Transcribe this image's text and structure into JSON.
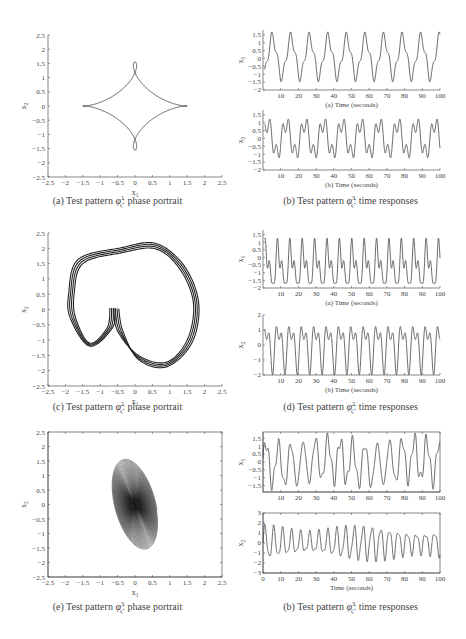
{
  "figures": [
    {
      "id": "a",
      "caption_prefix": "(a) Test pattern ",
      "caption_symbol": "φ",
      "caption_sup": "1",
      "caption_sub": "ς",
      "caption_suffix": ": phase portrait"
    },
    {
      "id": "b1",
      "caption_prefix": "(b) Test pattern ",
      "caption_symbol": "φ",
      "caption_sup": "3",
      "caption_sub": "ς",
      "caption_suffix": ": time responses"
    },
    {
      "id": "c",
      "caption_prefix": "(c) Test pattern ",
      "caption_symbol": "φ",
      "caption_sup": "2",
      "caption_sub": "ς",
      "caption_suffix": ": phase portrait"
    },
    {
      "id": "d",
      "caption_prefix": "(d) Test pattern ",
      "caption_symbol": "φ",
      "caption_sup": "2",
      "caption_sub": "ς",
      "caption_suffix": ": time responses"
    },
    {
      "id": "e",
      "caption_prefix": "(e) Test pattern ",
      "caption_symbol": "φ",
      "caption_sup": "3",
      "caption_sub": "ς",
      "caption_suffix": ": phase portrait"
    },
    {
      "id": "b2",
      "caption_prefix": "(b) Test pattern ",
      "caption_symbol": "φ",
      "caption_sup": "3",
      "caption_sub": "ς",
      "caption_suffix": ": time responses"
    }
  ],
  "chart_data": [
    {
      "panel": "a",
      "type": "line",
      "title": "(a) Test pattern φς1: phase portrait",
      "xlabel": "x1",
      "ylabel": "x2",
      "xlim": [
        -2.5,
        2.5
      ],
      "ylim": [
        -2.5,
        2.5
      ],
      "xticks": [
        "-2.5",
        "-2",
        "-1.5",
        "-1",
        "-0.5",
        "0",
        "0.5",
        "1",
        "1.5",
        "2",
        "2.5"
      ],
      "yticks": [
        "2.5",
        "2",
        "1.5",
        "1",
        "0.5",
        "0",
        "-0.5",
        "-1",
        "-1.5",
        "-2",
        "-2.5"
      ],
      "description": "Closed limit cycle with two small inner loops near x1=-1 and x1=1",
      "extent": {
        "x": [
          -1.6,
          1.6
        ],
        "y": [
          -1.45,
          1.45
        ]
      }
    },
    {
      "panel": "b-top",
      "type": "line",
      "sublabel": "(a) Time (seconds)",
      "ylabel": "x1",
      "xlim": [
        0,
        100
      ],
      "ylim": [
        -2,
        1.8
      ],
      "xticks": [
        "10",
        "20",
        "30",
        "40",
        "50",
        "60",
        "70",
        "80",
        "90",
        "100"
      ],
      "yticks": [
        "1.5",
        "1",
        "0.5",
        "0",
        "-0.5",
        "-1",
        "-1.5",
        "-2"
      ],
      "period_s": 10.5,
      "range": [
        -1.7,
        1.6
      ]
    },
    {
      "panel": "b-bottom",
      "type": "line",
      "sublabel": "(b) Time (seconds)",
      "ylabel": "x2",
      "xlim": [
        0,
        100
      ],
      "ylim": [
        -2,
        1.8
      ],
      "xticks": [
        "10",
        "20",
        "30",
        "40",
        "50",
        "60",
        "70",
        "80",
        "90",
        "100"
      ],
      "yticks": [
        "1.5",
        "1",
        "0.5",
        "0",
        "-0.5",
        "-1",
        "-1.5",
        "-2"
      ],
      "period_s": 10.5,
      "range": [
        -1.5,
        1.5
      ]
    },
    {
      "panel": "c",
      "type": "line",
      "title": "(c) Test pattern φς2: phase portrait",
      "xlabel": "x1",
      "ylabel": "x2",
      "xlim": [
        -2.5,
        2.5
      ],
      "ylim": [
        -2.5,
        2.5
      ],
      "xticks": [
        "-2.5",
        "-2",
        "-1.5",
        "-1",
        "-0.5",
        "0",
        "0.5",
        "1",
        "1.5",
        "2",
        "2.5"
      ],
      "yticks": [
        "2.5",
        "2",
        "1.5",
        "1",
        "0.5",
        "0",
        "-0.5",
        "-1",
        "-1.5",
        "-2",
        "-2.5"
      ],
      "description": "Thick heart-shaped limit cycle with cusp near x1=-0.7",
      "extent": {
        "x": [
          -1.75,
          1.7
        ],
        "y": [
          -1.75,
          2.0
        ]
      }
    },
    {
      "panel": "d-top",
      "type": "line",
      "sublabel": "(a) Time (seconds)",
      "ylabel": "x1",
      "xlim": [
        0,
        100
      ],
      "ylim": [
        -2,
        1.8
      ],
      "xticks": [
        "10",
        "20",
        "30",
        "40",
        "50",
        "60",
        "70",
        "80",
        "90",
        "100"
      ],
      "yticks": [
        "1.5",
        "1",
        "0.5",
        "0",
        "-0.5",
        "-1",
        "-1.5",
        "-2"
      ],
      "period_s": 7.0,
      "range": [
        -1.8,
        1.7
      ]
    },
    {
      "panel": "d-bottom",
      "type": "line",
      "sublabel": "(b) Time (seconds)",
      "ylabel": "x2",
      "xlim": [
        0,
        100
      ],
      "ylim": [
        -2,
        2
      ],
      "xticks": [
        "10",
        "20",
        "30",
        "40",
        "50",
        "60",
        "70",
        "80",
        "90",
        "100"
      ],
      "yticks": [
        "2",
        "1",
        "0",
        "-1",
        "-2"
      ],
      "period_s": 7.0,
      "range": [
        -1.7,
        2.0
      ]
    },
    {
      "panel": "e",
      "type": "line",
      "title": "(e) Test pattern φς3: phase portrait",
      "xlabel": "x1",
      "ylabel": "x2",
      "xlim": [
        -2.5,
        2.5
      ],
      "ylim": [
        -2.5,
        2.5
      ],
      "xticks": [
        "-2.5",
        "-2",
        "-1.5",
        "-1",
        "-0.5",
        "0",
        "0.5",
        "1",
        "1.5",
        "2",
        "2.5"
      ],
      "yticks": [
        "2.5",
        "2",
        "1.5",
        "1",
        "0.5",
        "0",
        "-0.5",
        "-1",
        "-1.5",
        "-2",
        "-2.5"
      ],
      "description": "Chaotic double-scroll attractor with foci near x1=-1 and x1=1",
      "extent": {
        "x": [
          -1.85,
          1.85
        ],
        "y": [
          -2.2,
          2.2
        ]
      }
    },
    {
      "panel": "b2-top",
      "type": "line",
      "ylabel": "x1",
      "xlim": [
        0,
        100
      ],
      "ylim": [
        -1.9,
        1.9
      ],
      "xticks": [
        "10",
        "20",
        "30",
        "40",
        "50",
        "60",
        "70",
        "80",
        "90",
        "100"
      ],
      "yticks": [
        "1.5",
        "1",
        "0.5",
        "0",
        "-0.5",
        "-1",
        "-1.5"
      ],
      "range": [
        -1.8,
        1.8
      ]
    },
    {
      "panel": "b2-bottom",
      "type": "line",
      "xlabel": "Time (seconds)",
      "ylabel": "x2",
      "xlim": [
        0,
        100
      ],
      "ylim": [
        -3,
        3
      ],
      "xticks": [
        "0",
        "10",
        "20",
        "30",
        "40",
        "50",
        "60",
        "70",
        "80",
        "90",
        "100"
      ],
      "yticks": [
        "3",
        "2",
        "1",
        "0",
        "-1",
        "-2",
        "-3"
      ],
      "range": [
        -2.3,
        2.2
      ]
    }
  ],
  "labels": {
    "x1": "x",
    "x2": "x",
    "time_a": "(a) Time (seconds)",
    "time_b": "(b) Time (seconds)",
    "time_plain": "Time (seconds)"
  }
}
